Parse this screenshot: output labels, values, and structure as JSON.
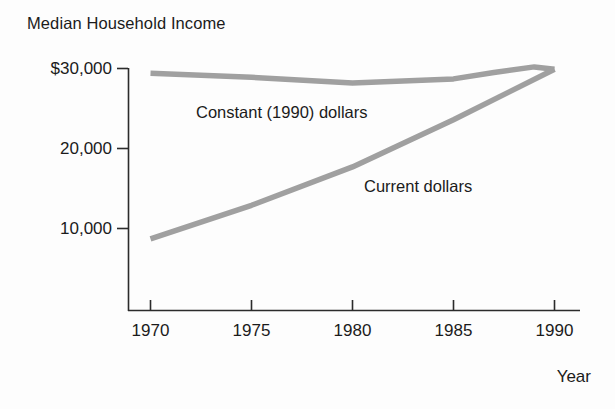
{
  "chart_data": {
    "type": "line",
    "title": "Median Household Income",
    "subtitle": "",
    "xlabel": "Year",
    "ylabel": "",
    "x": [
      1970,
      1975,
      1980,
      1985,
      1990
    ],
    "xlim": [
      1969,
      1991
    ],
    "ylim": [
      0,
      31000
    ],
    "grid": false,
    "legend_position": "inline-annotations",
    "y_ticks": [
      {
        "value": 30000,
        "label": "$30,000"
      },
      {
        "value": 20000,
        "label": "20,000"
      },
      {
        "value": 10000,
        "label": "10,000"
      }
    ],
    "x_ticks": [
      {
        "value": 1970,
        "label": "1970"
      },
      {
        "value": 1975,
        "label": "1975"
      },
      {
        "value": 1980,
        "label": "1980"
      },
      {
        "value": 1985,
        "label": "1985"
      },
      {
        "value": 1990,
        "label": "1990"
      }
    ],
    "series": [
      {
        "name": "Constant (1990) dollars",
        "color": "#a0a0a0",
        "annotation": "Constant (1990) dollars",
        "x": [
          1970,
          1975,
          1980,
          1985,
          1987,
          1989,
          1990
        ],
        "values": [
          29400,
          28900,
          28200,
          28700,
          29500,
          30200,
          29900
        ]
      },
      {
        "name": "Current dollars",
        "color": "#a0a0a0",
        "annotation": "Current dollars",
        "x": [
          1970,
          1975,
          1980,
          1985,
          1990
        ],
        "values": [
          8700,
          12900,
          17700,
          23600,
          29900
        ]
      }
    ],
    "annotations": [
      {
        "text": "Constant (1990) dollars",
        "x": 1975.6,
        "y": 25600
      },
      {
        "text": "Current dollars",
        "x": 1983.6,
        "y": 16400
      }
    ]
  },
  "axes": {
    "y_tick_0": "$30,000",
    "y_tick_1": "20,000",
    "y_tick_2": "10,000",
    "x_tick_0": "1970",
    "x_tick_1": "1975",
    "x_tick_2": "1980",
    "x_tick_3": "1985",
    "x_tick_4": "1990",
    "x_axis_name": "Year"
  },
  "colors": {
    "series_line": "#a0a0a0",
    "axis": "#2b2b2b",
    "text": "#1b1b1b",
    "background": "#fdfdfd"
  }
}
